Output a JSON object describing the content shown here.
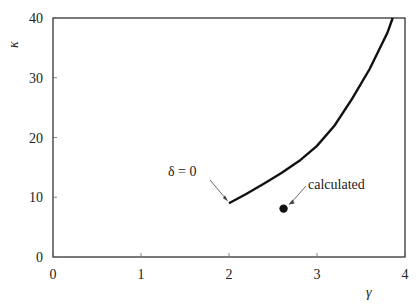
{
  "chart_data": {
    "type": "line",
    "title": "",
    "xlabel": "γ",
    "ylabel": "κ",
    "xlim": [
      0,
      4
    ],
    "ylim": [
      0,
      40
    ],
    "x_ticks": [
      "0",
      "1",
      "2",
      "3",
      "4"
    ],
    "y_ticks": [
      "0",
      "10",
      "20",
      "30",
      "40"
    ],
    "grid": false,
    "legend": null,
    "series": [
      {
        "name": "δ = 0",
        "type": "line",
        "x": [
          2.0,
          2.2,
          2.4,
          2.6,
          2.8,
          3.0,
          3.2,
          3.4,
          3.6,
          3.8,
          3.86
        ],
        "y": [
          9.0,
          10.6,
          12.3,
          14.1,
          16.1,
          18.6,
          22.0,
          26.5,
          31.5,
          37.5,
          40.0
        ]
      },
      {
        "name": "calculated",
        "type": "scatter",
        "x": [
          2.62
        ],
        "y": [
          8.1
        ]
      }
    ],
    "annotations": [
      {
        "text": "δ = 0",
        "points_to": [
          2.0,
          9.0
        ]
      },
      {
        "text": "calculated",
        "points_to": [
          2.62,
          8.1
        ]
      }
    ]
  }
}
